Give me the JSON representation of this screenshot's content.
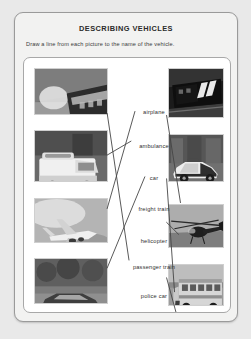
{
  "worksheet": {
    "title": "DESCRIBING VEHICLES",
    "instruction": "Draw a line from each picture to the name of the vehicle."
  },
  "labels": [
    {
      "id": "airplane",
      "text": "airplane",
      "x": 130,
      "y": 51
    },
    {
      "id": "ambulance",
      "text": "ambulance",
      "x": 130,
      "y": 85
    },
    {
      "id": "car",
      "text": "car",
      "x": 130,
      "y": 117
    },
    {
      "id": "freight-train",
      "text": "freight train",
      "x": 130,
      "y": 148
    },
    {
      "id": "helicopter",
      "text": "helicopter",
      "x": 130,
      "y": 180
    },
    {
      "id": "passenger-train",
      "text": "passenger train",
      "x": 130,
      "y": 206
    },
    {
      "id": "police-car",
      "text": "police car",
      "x": 130,
      "y": 235
    },
    {
      "id": "school-bus",
      "text": "school bus",
      "x": 130,
      "y": 265
    }
  ],
  "pictures": [
    {
      "id": "passenger-train-photo",
      "subject": "passenger train",
      "column": "left",
      "x": 10,
      "y": 10,
      "w": 74,
      "h": 47
    },
    {
      "id": "ambulance-photo",
      "subject": "ambulance",
      "column": "left",
      "x": 10,
      "y": 72,
      "w": 74,
      "h": 52
    },
    {
      "id": "airplane-photo",
      "subject": "airplane",
      "column": "left",
      "x": 10,
      "y": 140,
      "w": 74,
      "h": 45
    },
    {
      "id": "car-photo",
      "subject": "car",
      "column": "left",
      "x": 10,
      "y": 200,
      "w": 74,
      "h": 46
    },
    {
      "id": "freight-train-photo",
      "subject": "freight train",
      "column": "right",
      "x": 144,
      "y": 10,
      "w": 56,
      "h": 50
    },
    {
      "id": "police-car-photo",
      "subject": "police car",
      "column": "right",
      "x": 144,
      "y": 76,
      "w": 56,
      "h": 48
    },
    {
      "id": "helicopter-photo",
      "subject": "helicopter",
      "column": "right",
      "x": 144,
      "y": 146,
      "w": 56,
      "h": 44
    },
    {
      "id": "school-bus-photo",
      "subject": "school bus",
      "column": "right",
      "x": 144,
      "y": 206,
      "w": 56,
      "h": 42
    }
  ],
  "answer_lines": [
    {
      "from": "passenger-train-photo",
      "to": "passenger-train",
      "x1": 84,
      "y1": 56,
      "x2": 106,
      "y2": 204
    },
    {
      "from": "ambulance-photo",
      "to": "ambulance",
      "x1": 84,
      "y1": 98,
      "x2": 108,
      "y2": 84
    },
    {
      "from": "airplane-photo",
      "to": "airplane",
      "x1": 84,
      "y1": 152,
      "x2": 112,
      "y2": 54
    },
    {
      "from": "car-photo",
      "to": "car",
      "x1": 84,
      "y1": 212,
      "x2": 122,
      "y2": 120
    },
    {
      "from": "freight-train-photo",
      "to": "freight-train",
      "x1": 144,
      "y1": 58,
      "x2": 158,
      "y2": 146
    },
    {
      "from": "police-car-photo",
      "to": "police-car",
      "x1": 144,
      "y1": 122,
      "x2": 152,
      "y2": 236
    },
    {
      "from": "helicopter-photo",
      "to": "helicopter",
      "x1": 144,
      "y1": 166,
      "x2": 156,
      "y2": 178
    },
    {
      "from": "school-bus-photo",
      "to": "school-bus",
      "x1": 144,
      "y1": 222,
      "x2": 156,
      "y2": 266
    }
  ],
  "colors": {
    "page_background": "#e9e9e9",
    "frame_background": "#f2f2f1",
    "panel_background": "#ffffff",
    "ink": "#2e2e2e",
    "line_ink": "#444444"
  }
}
